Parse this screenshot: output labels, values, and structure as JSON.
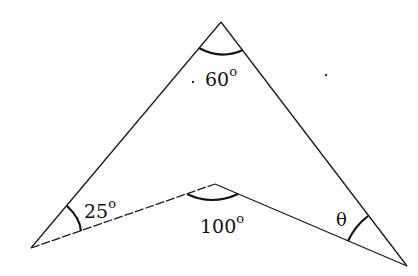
{
  "figure": {
    "type": "concave quadrilateral (arrowhead) angle diagram",
    "vertices": {
      "top": [
        221,
        22
      ],
      "left": [
        31,
        248
      ],
      "inner": [
        215,
        184
      ],
      "right": [
        407,
        266
      ]
    },
    "angles": [
      {
        "name": "top",
        "value": "60",
        "unit": "o"
      },
      {
        "name": "left",
        "value": "25",
        "unit": "o"
      },
      {
        "name": "inner",
        "value": "100",
        "unit": "o"
      },
      {
        "name": "right",
        "value": "θ",
        "unit": ""
      }
    ],
    "colors": {
      "line": "#1a1a1a",
      "background": "#ffffff"
    }
  }
}
